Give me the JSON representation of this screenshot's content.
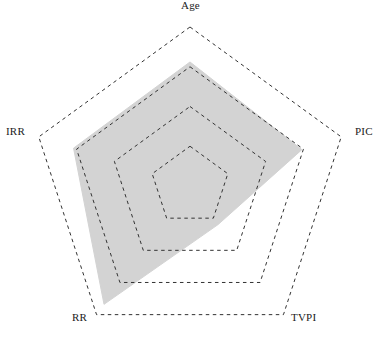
{
  "chart_data": {
    "type": "radar",
    "title": "",
    "subtitle": "",
    "xlabel": "",
    "ylabel": "",
    "categories": [
      "Age",
      "PIC",
      "TVPI",
      "RR",
      "IRR"
    ],
    "series": [
      {
        "name": "",
        "values": [
          0.78,
          0.74,
          0.3,
          0.92,
          0.77
        ],
        "fill_color": "#d3d3d3",
        "line_color": "#d3d3d3"
      }
    ],
    "rlim": [
      0,
      1
    ],
    "grid": true,
    "grid_rings": [
      0.25,
      0.5,
      0.75,
      1.0
    ],
    "grid_style": "dashed",
    "grid_color": "#333333",
    "grid_shape": "polygon",
    "tick_labels": [],
    "legend": null,
    "legend_position": "none",
    "axis_lines": false,
    "annotations": []
  },
  "geometry": {
    "center_x": 190,
    "center_y": 186,
    "outer_radius": 159,
    "start_angle_deg": -90
  },
  "labels": {
    "age": "Age",
    "pic": "PIC",
    "tvpi": "TVPI",
    "rr": "RR",
    "irr": "IRR"
  },
  "colors": {
    "background": "#ffffff",
    "fill": "#d3d3d3",
    "grid": "#333333",
    "text": "#1b1b1b"
  }
}
